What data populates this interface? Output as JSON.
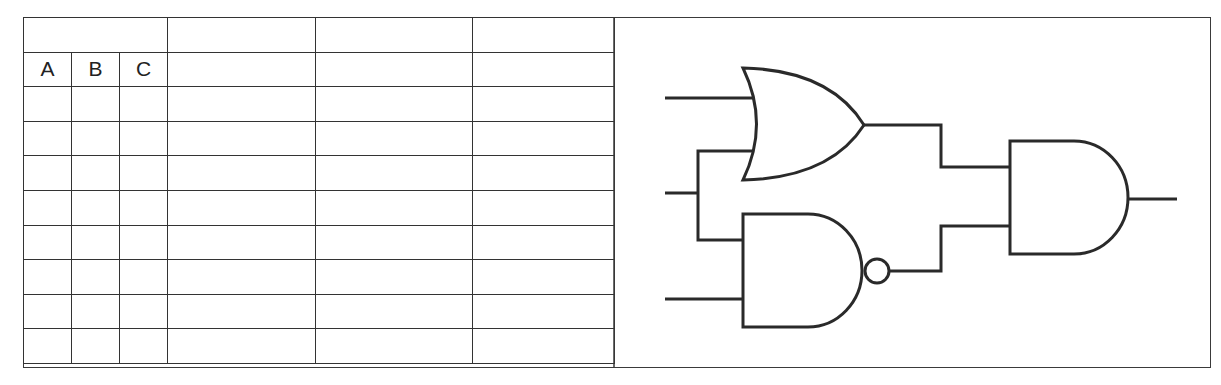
{
  "truth_table": {
    "header_row": [
      "",
      "",
      "",
      ""
    ],
    "columns": [
      "A",
      "B",
      "C",
      "",
      "",
      ""
    ],
    "rows": [
      [
        "",
        "",
        "",
        "",
        "",
        ""
      ],
      [
        "",
        "",
        "",
        "",
        "",
        ""
      ],
      [
        "",
        "",
        "",
        "",
        "",
        ""
      ],
      [
        "",
        "",
        "",
        "",
        "",
        ""
      ],
      [
        "",
        "",
        "",
        "",
        "",
        ""
      ],
      [
        "",
        "",
        "",
        "",
        "",
        ""
      ],
      [
        "",
        "",
        "",
        "",
        "",
        ""
      ],
      [
        "",
        "",
        "",
        "",
        "",
        ""
      ]
    ]
  },
  "circuit": {
    "gates": [
      {
        "type": "OR",
        "inputs": [
          "input-1",
          "input-2"
        ]
      },
      {
        "type": "NAND",
        "inputs": [
          "input-2",
          "input-3"
        ]
      },
      {
        "type": "AND",
        "inputs": [
          "OR",
          "NAND"
        ]
      }
    ],
    "line_color": "#2a2a2a"
  }
}
